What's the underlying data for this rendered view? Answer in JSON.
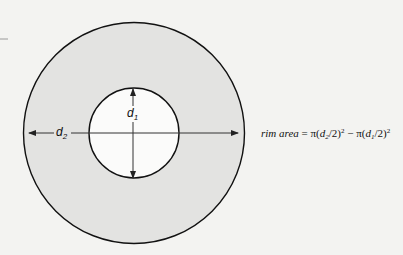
{
  "diagram": {
    "type": "annulus",
    "colors": {
      "background": "#f3f3f1",
      "ring_fill": "#e3e3e1",
      "inner_fill": "#fbfbfa",
      "stroke": "#111111",
      "axis_line": "#333333"
    },
    "outer_circle": {
      "cx": 134,
      "cy": 133,
      "r": 110
    },
    "inner_circle": {
      "cx": 134,
      "cy": 133,
      "r": 45
    },
    "labels": {
      "d2": {
        "base": "d",
        "sub": "2"
      },
      "d1": {
        "base": "d",
        "sub": "1"
      }
    },
    "formula": {
      "lhs": "rim area",
      "equals": " = ",
      "term1_prefix": "π(",
      "term1_var": "d",
      "term1_sub": "2",
      "term1_suffix": "/2)",
      "term1_exp": "2",
      "minus": " − ",
      "term2_prefix": "π(",
      "term2_var": "d",
      "term2_sub": "1",
      "term2_suffix": "/2)",
      "term2_exp": "2"
    }
  }
}
